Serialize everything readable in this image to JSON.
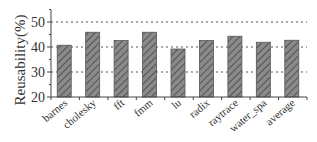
{
  "chart_data": {
    "type": "bar",
    "title": "",
    "xlabel": "",
    "ylabel": "Reusability(%)",
    "ylim": [
      20,
      55
    ],
    "yticks": [
      20,
      30,
      40,
      50
    ],
    "grid": "horizontal dotted at 30, 40, 50",
    "legend": null,
    "categories": [
      "barnes",
      "cholesky",
      "fft",
      "fmm",
      "lu",
      "radix",
      "raytrace",
      "water_spa",
      "average"
    ],
    "values": [
      40.7,
      45.9,
      42.6,
      45.9,
      39.2,
      42.6,
      44.3,
      41.9,
      42.7
    ],
    "bar_pattern": "diagonal hatch",
    "bar_color": "#7a7a7a"
  },
  "axis": {
    "y_title": "Reusability(%)",
    "y_tick_labels": [
      "20",
      "30",
      "40",
      "50"
    ]
  }
}
